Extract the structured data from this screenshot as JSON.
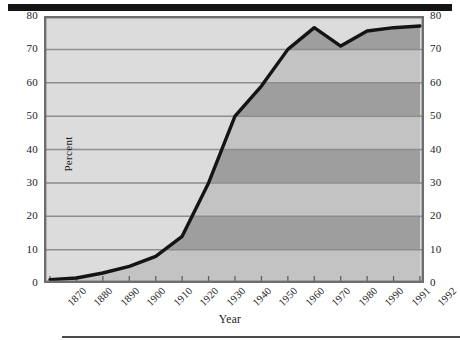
{
  "figure": {
    "top_rule": "",
    "bottom_rule": ""
  },
  "axes": {
    "y_title": "Percent",
    "x_title": "Year",
    "y_ticks": [
      "0",
      "10",
      "20",
      "30",
      "40",
      "50",
      "60",
      "70",
      "80"
    ],
    "x_ticks": [
      "1870",
      "1880",
      "1890",
      "1900",
      "1910",
      "1920",
      "1930",
      "1940",
      "1950",
      "1960",
      "1970",
      "1980",
      "1990",
      "1991",
      "1992"
    ]
  },
  "colors": {
    "line": "#141414",
    "plot_background": "#dcdcdc",
    "fill_band_light": "#c3c3c3",
    "fill_band_dark": "#9e9e9e",
    "gridline": "#8d8d8d",
    "frame": "#6e6e6e",
    "text": "#1b1b1b"
  },
  "chart_data": {
    "type": "area",
    "title": "",
    "xlabel": "Year",
    "ylabel": "Percent",
    "grid": true,
    "legend": "none",
    "xlim": [
      0,
      14
    ],
    "ylim": [
      0,
      80
    ],
    "ytick_values": [
      0,
      10,
      20,
      30,
      40,
      50,
      60,
      70,
      80
    ],
    "categories": [
      "1870",
      "1880",
      "1890",
      "1900",
      "1910",
      "1920",
      "1930",
      "1940",
      "1950",
      "1960",
      "1970",
      "1980",
      "1990",
      "1991",
      "1992"
    ],
    "values": [
      1,
      1.5,
      3,
      5,
      8,
      14,
      30,
      50,
      59,
      70,
      76.5,
      71,
      75.5,
      76.5,
      77
    ],
    "series": [
      {
        "name": "Percent",
        "values": [
          1,
          1.5,
          3,
          5,
          8,
          14,
          30,
          50,
          59,
          70,
          76.5,
          71,
          75.5,
          76.5,
          77
        ]
      }
    ]
  }
}
